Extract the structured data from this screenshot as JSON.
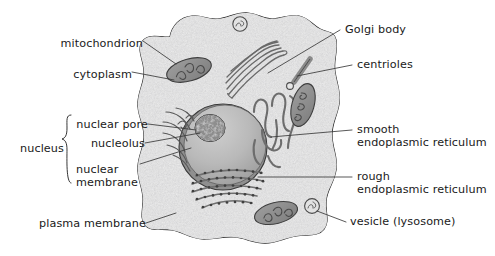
{
  "diagram": {
    "type": "labeled-biological-diagram",
    "background_color": "#ffffff",
    "cell_fill": "#ededed",
    "outline_color": "#1f1f1f"
  },
  "labels": {
    "mitochondrion": "mitochondrion",
    "cytoplasm": "cytoplasm",
    "nuclear_pore": "nuclear pore",
    "nucleolus": "nucleolus",
    "nuclear_membrane_l1": "nuclear",
    "nuclear_membrane_l2": "membrane",
    "nucleus": "nucleus",
    "plasma_membrane": "plasma membrane",
    "golgi_body": "Golgi body",
    "centrioles": "centrioles",
    "smooth_er_l1": "smooth",
    "smooth_er_l2": "endoplasmic reticulum",
    "rough_er_l1": "rough",
    "rough_er_l2": "endoplasmic reticulum",
    "vesicle": "vesicle (lysosome)"
  },
  "structures": [
    {
      "name": "plasma-membrane",
      "description": "irregular rounded cell boundary"
    },
    {
      "name": "cytoplasm",
      "description": "speckled grey interior"
    },
    {
      "name": "nucleus",
      "description": "large grey oval left-of-centre"
    },
    {
      "name": "nucleolus",
      "description": "dark mottled sphere inside nucleus"
    },
    {
      "name": "nuclear-pore",
      "description": "curved slits at nuclear membrane edge"
    },
    {
      "name": "golgi-body",
      "description": "stack of curved flattened sacs, upper centre"
    },
    {
      "name": "centrioles",
      "description": "short rod plus small circle, upper right"
    },
    {
      "name": "smooth-endoplasmic-reticulum",
      "description": "winding tubules right of nucleus"
    },
    {
      "name": "rough-endoplasmic-reticulum",
      "description": "curved sheets studded with ribosome dots below nucleus"
    },
    {
      "name": "mitochondrion",
      "description": "bean-shaped organelles with internal cristae"
    },
    {
      "name": "vesicle",
      "description": "small circles with internal marks"
    }
  ],
  "label_positions": {
    "mitochondrion": {
      "x": 55,
      "y": 38,
      "align": "left"
    },
    "cytoplasm": {
      "x": 75,
      "y": 68,
      "align": "left"
    },
    "nuclear_pore": {
      "x": 74,
      "y": 119,
      "align": "left"
    },
    "nucleolus": {
      "x": 85,
      "y": 140,
      "align": "left"
    },
    "nuclear_membrane": {
      "x": 82,
      "y": 165,
      "align": "left"
    },
    "nucleus": {
      "x": 22,
      "y": 150,
      "align": "left"
    },
    "plasma_membrane": {
      "x": 40,
      "y": 219,
      "align": "left"
    },
    "golgi_body": {
      "x": 345,
      "y": 25,
      "align": "right"
    },
    "centrioles": {
      "x": 357,
      "y": 60,
      "align": "right"
    },
    "smooth_er": {
      "x": 357,
      "y": 128,
      "align": "right"
    },
    "rough_er": {
      "x": 357,
      "y": 174,
      "align": "right"
    },
    "vesicle": {
      "x": 350,
      "y": 221,
      "align": "right"
    }
  }
}
